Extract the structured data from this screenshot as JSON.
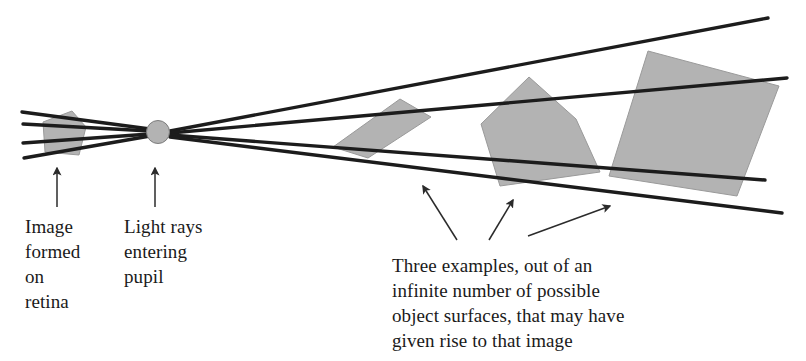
{
  "figure": {
    "colors": {
      "ray_line": "#1c1c1c",
      "surface_fill": "#b3b3b3",
      "surface_stroke": "#8a8a8a",
      "pupil_fill": "#b3b3b3",
      "pupil_stroke": "#7d7d7d",
      "arrow": "#2b2b2b",
      "text": "#1a1a1a",
      "background": "#ffffff"
    },
    "elements": {
      "pupil": {
        "name": "pupil-circle",
        "cx": 158,
        "cy": 132,
        "r": 11
      },
      "retina_patch": {
        "name": "retina-image-patch"
      },
      "rays": [
        {
          "name": "ray-top",
          "x1": 170,
          "y1": 131,
          "x2": 768,
          "y2": 18
        },
        {
          "name": "ray-upper-middle",
          "x1": 170,
          "y1": 133,
          "x2": 787,
          "y2": 78
        },
        {
          "name": "ray-lower-middle",
          "x1": 170,
          "y1": 135,
          "x2": 765,
          "y2": 180
        },
        {
          "name": "ray-bottom",
          "x1": 170,
          "y1": 137,
          "x2": 782,
          "y2": 213
        },
        {
          "name": "ray-retina-top",
          "x1": 148,
          "y1": 130,
          "x2": 22,
          "y2": 112
        },
        {
          "name": "ray-retina-upper",
          "x1": 148,
          "y1": 131,
          "x2": 23,
          "y2": 124
        },
        {
          "name": "ray-retina-lower",
          "x1": 148,
          "y1": 134,
          "x2": 23,
          "y2": 143
        },
        {
          "name": "ray-retina-bottom",
          "x1": 148,
          "y1": 136,
          "x2": 24,
          "y2": 158
        }
      ],
      "surfaces": [
        {
          "name": "object-surface-near",
          "points": "400,99 431,117 368,158 333,147"
        },
        {
          "name": "object-surface-middle",
          "points": "529,77 576,119 600,172 500,186 481,124"
        },
        {
          "name": "object-surface-far",
          "points": "648,51 779,86 737,196 609,176"
        }
      ],
      "arrows": [
        {
          "name": "arrow-to-retina",
          "x1": 57,
          "y1": 207,
          "x2": 57,
          "y2": 166
        },
        {
          "name": "arrow-to-pupil",
          "x1": 155,
          "y1": 207,
          "x2": 155,
          "y2": 166
        },
        {
          "name": "arrow-to-surface-near",
          "x1": 457,
          "y1": 240,
          "x2": 421,
          "y2": 183
        },
        {
          "name": "arrow-to-surface-middle",
          "x1": 489,
          "y1": 240,
          "x2": 514,
          "y2": 198
        },
        {
          "name": "arrow-to-surface-far",
          "x1": 528,
          "y1": 236,
          "x2": 612,
          "y2": 205
        }
      ]
    }
  },
  "labels": {
    "retina": "Image\nformed\non\nretina",
    "pupil": "Light rays\nentering\npupil",
    "surfaces": "Three examples, out of an\ninfinite number of possible\nobject surfaces, that may have\ngiven rise to that image"
  }
}
